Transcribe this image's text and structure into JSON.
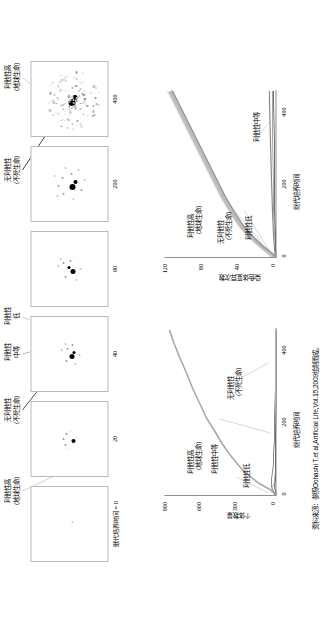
{
  "figure": {
    "panels_caption_prefix": "继代培养时间 = 0",
    "panel_captions": [
      "继代培养时间 = 0",
      "20",
      "40",
      "80",
      "200",
      "400"
    ],
    "annotations_top": [
      {
        "id": "a1",
        "text": "利他性高\n（地球生命）"
      },
      {
        "id": "a2",
        "text": "无利他性\n（不死生命）"
      },
      {
        "id": "a3",
        "text": "利他性\n中等"
      },
      {
        "id": "a4",
        "text": "利他性\n低"
      },
      {
        "id": "a5",
        "text": "无利他性\n（不死生命）"
      },
      {
        "id": "a6",
        "text": "利他性高\n（地球生命）"
      }
    ],
    "annotation_lines": [
      {
        "text": "利他性高"
      },
      {
        "text": "（地球生命）"
      },
      {
        "text": "无利他性"
      },
      {
        "text": "（不死生命）"
      },
      {
        "text": "利他性中等"
      },
      {
        "text": "利他性低"
      },
      {
        "text": "利他性"
      },
      {
        "text": "中等"
      },
      {
        "text": "低"
      }
    ]
  },
  "chart_left": {
    "title": "",
    "ylabel": "个体数量",
    "xlabel": "继代培养时间",
    "yticks": [
      "0",
      "300",
      "600",
      "900"
    ],
    "xticks": [
      "0",
      "200",
      "400"
    ],
    "inline_labels": [
      {
        "id": "l1",
        "text": "利他性高\n（地球生命）"
      },
      {
        "id": "l2",
        "text": "利他性中等"
      },
      {
        "id": "l3",
        "text": "利他性低"
      },
      {
        "id": "l4",
        "text": "无利他性\n（不死生命）"
      }
    ]
  },
  "chart_right": {
    "title": "",
    "ylabel": "染色体变异次数",
    "xlabel": "继代培养时间",
    "yticks": [
      "0",
      "40",
      "80",
      "120"
    ],
    "xticks": [
      "0",
      "200",
      "400"
    ],
    "inline_labels": [
      {
        "id": "r1",
        "text": "利他性高\n（地球生命）"
      },
      {
        "id": "r2",
        "text": "无利他性\n（不死生命）"
      },
      {
        "id": "r3",
        "text": "利他性低"
      },
      {
        "id": "r4",
        "text": "利他性中等"
      }
    ]
  },
  "source": {
    "text": "资料来源：参照Oohashi T.et al,Artificial Life,Vol.15,2009绘制而成。"
  },
  "colors": {
    "axis": "#8d8d8d",
    "panel_border": "#b9b9b9",
    "text": "#000000",
    "series_dark": "#1a1a1a",
    "series_mid": "#8f8f8f",
    "series_light": "#c6c6c6"
  },
  "chart_data": [
    {
      "type": "line",
      "name": "chart_left",
      "title": "",
      "xlabel": "继代培养时间",
      "ylabel": "个体数量",
      "xlim": [
        0,
        440
      ],
      "ylim": [
        0,
        980
      ],
      "yticks": [
        0,
        300,
        600,
        900
      ],
      "xticks": [
        0,
        200,
        400
      ],
      "grid": false,
      "legend": "inline",
      "series": [
        {
          "name": "利他性高（地球生命）",
          "x": [
            0,
            10,
            20,
            30,
            40,
            60,
            80,
            110,
            140,
            170,
            200,
            240,
            280,
            320,
            360,
            400,
            430
          ],
          "values": [
            5,
            30,
            90,
            150,
            200,
            275,
            340,
            420,
            490,
            550,
            605,
            672,
            730,
            788,
            845,
            900,
            938
          ]
        },
        {
          "name": "利他性中等",
          "x": [
            0,
            10,
            20,
            30,
            40,
            60,
            80,
            110,
            140,
            200,
            280,
            360,
            430
          ],
          "values": [
            5,
            22,
            40,
            44,
            40,
            32,
            26,
            20,
            16,
            12,
            9,
            7,
            6
          ]
        },
        {
          "name": "利他性低",
          "x": [
            0,
            5,
            10,
            20,
            30,
            40,
            60,
            100,
            200,
            300,
            430
          ],
          "values": [
            4,
            30,
            48,
            34,
            20,
            13,
            8,
            5,
            3,
            2,
            2
          ]
        },
        {
          "name": "无利他性（不死生命）",
          "x": [
            0,
            10,
            20,
            40,
            80,
            160,
            240,
            320,
            430
          ],
          "values": [
            3,
            8,
            10,
            9,
            7,
            5,
            4,
            3,
            3
          ]
        }
      ]
    },
    {
      "type": "line",
      "name": "chart_right",
      "title": "",
      "xlabel": "继代培养时间",
      "ylabel": "染色体变异次数",
      "xlim": [
        0,
        440
      ],
      "ylim": [
        0,
        130
      ],
      "yticks": [
        0,
        40,
        80,
        120
      ],
      "xticks": [
        0,
        200,
        400
      ],
      "grid": false,
      "legend": "inline",
      "series": [
        {
          "name": "利他性高（地球生命）",
          "x": [
            0,
            10,
            20,
            40,
            60,
            90,
            120,
            160,
            200,
            240,
            280,
            320,
            360,
            400,
            430
          ],
          "values": [
            2,
            8,
            15,
            27,
            36,
            48,
            57,
            68,
            77,
            85,
            93,
            100,
            107,
            114,
            119
          ]
        },
        {
          "name": "利他性中等",
          "x": [
            0,
            20,
            60,
            120,
            200,
            300,
            400,
            430
          ],
          "values": [
            1,
            3,
            5,
            6,
            7,
            8,
            9,
            9
          ]
        },
        {
          "name": "利他性低",
          "x": [
            0,
            20,
            60,
            120,
            200,
            300,
            400,
            430
          ],
          "values": [
            1,
            2,
            3,
            4,
            4,
            5,
            5,
            5
          ]
        },
        {
          "name": "无利他性（不死生命）",
          "x": [
            0,
            20,
            60,
            120,
            200,
            300,
            400,
            430
          ],
          "values": [
            1,
            2,
            2,
            3,
            3,
            3,
            3,
            3
          ]
        }
      ]
    },
    {
      "type": "scatter",
      "name": "panels",
      "title": "继代培养时间序列散点图",
      "panels": [
        {
          "label": "继代培养时间 = 0",
          "points": 1,
          "spread": 0
        },
        {
          "label": "20",
          "points": 12,
          "spread": 10
        },
        {
          "label": "40",
          "points": 20,
          "spread": 14
        },
        {
          "label": "80",
          "points": 16,
          "spread": 12
        },
        {
          "label": "200",
          "points": 40,
          "spread": 18
        },
        {
          "label": "400",
          "points": 120,
          "spread": 30
        }
      ]
    }
  ]
}
